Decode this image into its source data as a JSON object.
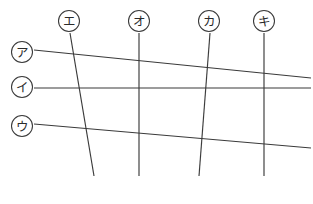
{
  "figure": {
    "width": 313,
    "height": 204,
    "background_color": "#ffffff",
    "line_color": "#3a3a3a",
    "label_text_color": "#2b2b2b",
    "label_circle_fill": "#ffffff",
    "label_circle_radius": 10.5,
    "line_width": 1.15
  },
  "chart_data": {
    "type": "line",
    "xlabel": "",
    "ylabel": "",
    "grid": false,
    "legend": "none",
    "xlim": [
      0,
      313
    ],
    "ylim": [
      204,
      0
    ],
    "series": [
      {
        "name": "ア",
        "orientation": "horizontal",
        "label_position": "left",
        "label_center": [
          22,
          52
        ],
        "x": [
          34,
          311
        ],
        "y": [
          50,
          78
        ]
      },
      {
        "name": "イ",
        "orientation": "horizontal",
        "label_position": "left",
        "label_center": [
          22,
          87
        ],
        "x": [
          34,
          311
        ],
        "y": [
          88,
          88
        ]
      },
      {
        "name": "ウ",
        "orientation": "horizontal",
        "label_position": "left",
        "label_center": [
          22,
          126
        ],
        "x": [
          34,
          311
        ],
        "y": [
          124,
          148
        ]
      },
      {
        "name": "エ",
        "orientation": "vertical",
        "label_position": "top",
        "label_center": [
          69,
          21
        ],
        "x": [
          70,
          94
        ],
        "y": [
          33,
          176
        ]
      },
      {
        "name": "オ",
        "orientation": "vertical",
        "label_position": "top",
        "label_center": [
          139,
          21
        ],
        "x": [
          139,
          139
        ],
        "y": [
          33,
          176
        ]
      },
      {
        "name": "カ",
        "orientation": "vertical",
        "label_position": "top",
        "label_center": [
          209,
          21
        ],
        "x": [
          210,
          199
        ],
        "y": [
          33,
          176
        ]
      },
      {
        "name": "キ",
        "orientation": "vertical",
        "label_position": "top",
        "label_center": [
          264,
          21
        ],
        "x": [
          264,
          264
        ],
        "y": [
          33,
          176
        ]
      }
    ]
  },
  "labels": {
    "row_labels": [
      {
        "id": "a",
        "text": "ア",
        "cx": 22,
        "cy": 52
      },
      {
        "id": "i",
        "text": "イ",
        "cx": 22,
        "cy": 87
      },
      {
        "id": "u",
        "text": "ウ",
        "cx": 22,
        "cy": 126
      }
    ],
    "column_labels": [
      {
        "id": "e",
        "text": "エ",
        "cx": 69,
        "cy": 21
      },
      {
        "id": "o",
        "text": "オ",
        "cx": 139,
        "cy": 21
      },
      {
        "id": "ka",
        "text": "カ",
        "cx": 209,
        "cy": 21
      },
      {
        "id": "ki",
        "text": "キ",
        "cx": 264,
        "cy": 21
      }
    ]
  }
}
